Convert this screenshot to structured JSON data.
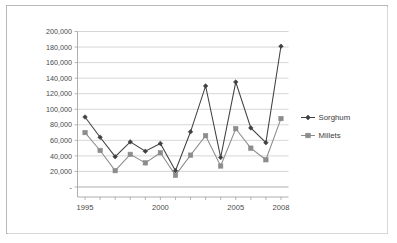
{
  "chart_data": {
    "type": "line",
    "title": "",
    "xlabel": "",
    "ylabel": "",
    "x": [
      1995,
      1996,
      1997,
      1998,
      1999,
      2000,
      2001,
      2002,
      2003,
      2004,
      2005,
      2006,
      2007,
      2008
    ],
    "xlim": [
      1994.5,
      2008.5
    ],
    "ylim": [
      0,
      200000
    ],
    "grid": true,
    "legend_position": "right",
    "y_tick_labels": [
      "200,000",
      "180,000",
      "160,000",
      "140,000",
      "120,000",
      "100,000",
      "80,000",
      "60,000",
      "40,000",
      "20,000",
      "-"
    ],
    "y_tick_values": [
      200000,
      180000,
      160000,
      140000,
      120000,
      100000,
      80000,
      60000,
      40000,
      20000,
      0
    ],
    "x_tick_labels": [
      "1995",
      "2000",
      "2005",
      "2008"
    ],
    "x_tick_values": [
      1995,
      2000,
      2005,
      2008
    ],
    "series": [
      {
        "name": "Sorghum",
        "color": "#404040",
        "marker": "diamond",
        "values": [
          90000,
          64000,
          39000,
          58000,
          46000,
          56000,
          21000,
          71000,
          130000,
          38000,
          135000,
          76000,
          57000,
          181000
        ]
      },
      {
        "name": "Millets",
        "color": "#8c8c8c",
        "marker": "square",
        "values": [
          70000,
          47000,
          21000,
          42000,
          31000,
          44000,
          15000,
          41000,
          66000,
          27000,
          75000,
          50000,
          35000,
          88000
        ]
      }
    ]
  },
  "legend": {
    "entries": [
      {
        "label": "Sorghum"
      },
      {
        "label": "Millets"
      }
    ]
  },
  "colors": {
    "sorghum": "#404040",
    "millets": "#8c8c8c",
    "gridline": "#c4c4c4",
    "axis": "#9a9a9a",
    "frame": "#b9b9b9",
    "text": "#4a4a4a",
    "background": "#ffffff"
  }
}
